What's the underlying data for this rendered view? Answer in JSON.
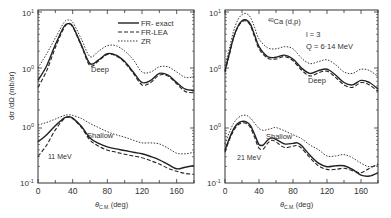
{
  "chart_data": [
    {
      "type": "line",
      "panel": "left",
      "annotation": "11 MeV",
      "xlabel": "θ_C.M. (deg)",
      "ylabel": "dσ/dΩ (mb/sr)",
      "xlim": [
        0,
        180
      ],
      "x_ticks": [
        0,
        40,
        80,
        120,
        160
      ],
      "y_tick_labels": [
        "10^1",
        "10^0",
        "10^0",
        "10^-1"
      ],
      "scale": "log",
      "legend": [
        "FR-exact",
        "FR-LEA",
        "ZR"
      ],
      "legend_position": "upper right",
      "groups": [
        {
          "name": "Deep",
          "x": [
            0,
            10,
            20,
            30,
            35,
            40,
            50,
            60,
            70,
            80,
            90,
            100,
            110,
            120,
            130,
            140,
            150,
            160,
            170,
            180
          ],
          "series": [
            {
              "name": "FR-exact",
              "values": [
                0.6,
                1.1,
                2.6,
                5.5,
                6.2,
                5.6,
                2.6,
                1.2,
                1.4,
                1.8,
                1.7,
                1.3,
                0.85,
                0.55,
                0.6,
                0.8,
                0.75,
                0.55,
                0.42,
                0.4
              ]
            },
            {
              "name": "FR-LEA",
              "values": [
                0.45,
                0.9,
                2.3,
                5.2,
                6.0,
                5.4,
                2.5,
                1.1,
                1.35,
                1.75,
                1.65,
                1.25,
                0.8,
                0.5,
                0.55,
                0.75,
                0.72,
                0.52,
                0.38,
                0.36
              ]
            },
            {
              "name": "ZR",
              "values": [
                1.0,
                1.8,
                3.4,
                6.5,
                7.2,
                6.6,
                3.3,
                1.6,
                2.0,
                2.5,
                2.5,
                2.0,
                1.4,
                0.85,
                0.85,
                1.05,
                1.05,
                0.85,
                0.68,
                0.7
              ]
            }
          ]
        },
        {
          "name": "Shallow",
          "x": [
            0,
            10,
            20,
            30,
            35,
            40,
            50,
            60,
            70,
            80,
            90,
            100,
            110,
            120,
            130,
            140,
            150,
            160,
            170,
            180
          ],
          "series": [
            {
              "name": "FR-exact",
              "values": [
                1.6,
                2.6,
                4.8,
                8.0,
                8.8,
                8.0,
                4.6,
                2.1,
                1.45,
                1.15,
                1.0,
                0.9,
                0.8,
                0.72,
                0.6,
                0.48,
                0.35,
                0.26,
                0.29,
                0.32
              ]
            },
            {
              "name": "FR-LEA",
              "values": [
                0.6,
                1.3,
                3.6,
                7.6,
                8.5,
                7.8,
                4.3,
                1.8,
                1.2,
                0.92,
                0.8,
                0.7,
                0.62,
                0.55,
                0.45,
                0.36,
                0.27,
                0.22,
                0.19,
                0.18
              ]
            },
            {
              "name": "ZR",
              "values": [
                5.0,
                6.0,
                7.5,
                9.5,
                10.0,
                9.6,
                7.8,
                5.6,
                4.2,
                3.2,
                2.6,
                2.2,
                1.8,
                1.5,
                1.5,
                1.4,
                1.05,
                0.75,
                0.72,
                0.8
              ]
            }
          ]
        }
      ]
    },
    {
      "type": "line",
      "panel": "right",
      "annotation": "21 MeV",
      "title": "40Ca (d,p)",
      "subtitle": [
        "l = 3",
        "Q = 6·14 MeV"
      ],
      "xlabel": "θ_C.M. (deg)",
      "ylabel": "",
      "xlim": [
        0,
        180
      ],
      "x_ticks": [
        0,
        40,
        80,
        120,
        160
      ],
      "y_tick_labels": [
        "10^1",
        "10^0",
        "10^0",
        "10^-1"
      ],
      "scale": "log",
      "groups": [
        {
          "name": "Deep",
          "x": [
            0,
            5,
            10,
            15,
            20,
            25,
            30,
            35,
            40,
            50,
            60,
            70,
            80,
            90,
            100,
            110,
            120,
            130,
            140,
            150,
            160,
            170,
            180
          ],
          "series": [
            {
              "name": "FR-exact",
              "values": [
                0.9,
                1.8,
                3.5,
                5.5,
                7.0,
                7.2,
                6.0,
                3.8,
                2.4,
                1.6,
                1.55,
                1.7,
                1.45,
                1.0,
                0.8,
                0.9,
                0.95,
                0.75,
                0.55,
                0.5,
                0.6,
                0.55,
                0.42
              ]
            },
            {
              "name": "FR-LEA",
              "values": [
                0.85,
                1.7,
                3.4,
                5.3,
                6.7,
                6.9,
                5.7,
                3.5,
                2.2,
                1.5,
                1.45,
                1.6,
                1.35,
                0.92,
                0.72,
                0.82,
                0.88,
                0.68,
                0.5,
                0.45,
                0.55,
                0.5,
                0.38
              ]
            },
            {
              "name": "ZR",
              "values": [
                1.1,
                2.2,
                4.5,
                7.2,
                9.0,
                9.4,
                8.0,
                5.2,
                3.3,
                2.3,
                2.2,
                2.4,
                2.2,
                1.5,
                1.2,
                1.3,
                1.4,
                1.15,
                0.85,
                0.8,
                0.95,
                0.9,
                0.7
              ]
            }
          ]
        },
        {
          "name": "Shallow",
          "x": [
            0,
            5,
            10,
            15,
            20,
            25,
            30,
            35,
            40,
            45,
            50,
            55,
            60,
            70,
            80,
            85,
            90,
            100,
            110,
            120,
            130,
            140,
            150,
            160,
            170,
            180
          ],
          "series": [
            {
              "name": "FR-exact",
              "values": [
                0.9,
                2.0,
                3.8,
                5.6,
                6.4,
                6.2,
                4.8,
                2.6,
                1.35,
                1.3,
                1.8,
                2.1,
                1.9,
                1.4,
                1.45,
                1.5,
                1.25,
                0.65,
                0.38,
                0.3,
                0.32,
                0.32,
                0.25,
                0.17,
                0.16,
                0.2
              ]
            },
            {
              "name": "FR-LEA",
              "values": [
                0.8,
                1.8,
                3.4,
                5.0,
                5.8,
                5.6,
                4.2,
                2.1,
                1.05,
                1.0,
                1.45,
                1.8,
                1.6,
                1.1,
                1.2,
                1.25,
                1.05,
                0.55,
                0.32,
                0.25,
                0.25,
                0.27,
                0.23,
                0.2,
                0.27,
                0.36
              ]
            },
            {
              "name": "ZR",
              "values": [
                1.4,
                3.0,
                5.6,
                8.0,
                9.5,
                9.6,
                8.0,
                5.6,
                4.0,
                3.5,
                3.7,
                4.0,
                4.2,
                3.4,
                2.6,
                2.3,
                2.0,
                1.3,
                0.95,
                0.62,
                0.62,
                0.68,
                0.55,
                0.38,
                0.3,
                0.34
              ]
            }
          ]
        }
      ]
    }
  ],
  "labels": {
    "left": {
      "y_top": "10",
      "y_top_exp": "1",
      "y_mid_up": "10",
      "y_mid_up_exp": "0",
      "y_mid_low": "10",
      "y_mid_low_exp": "0",
      "y_bot": "10",
      "y_bot_exp": "-1",
      "ylabel": "dσ /dΩ  (mb/sr)",
      "deep": "Deep",
      "shallow": "Shallow",
      "energy": "11 MeV",
      "xlabel_theta": "θ",
      "xlabel_sub": "C.M.",
      "xlabel_unit": "(deg)",
      "x_ticks": [
        "0",
        "40",
        "80",
        "120",
        "160"
      ],
      "legend": [
        {
          "label": "FR- exact",
          "style": "solid"
        },
        {
          "label": "FR-LEA",
          "style": "dashed"
        },
        {
          "label": "ZR",
          "style": "dotted"
        }
      ]
    },
    "right": {
      "y_top": "10",
      "y_top_exp": "1",
      "y_mid_up": "10",
      "y_mid_up_exp": "0",
      "y_mid_low": "10",
      "y_mid_low_exp": "0",
      "y_bot": "10",
      "y_bot_exp": "-1",
      "reaction_sup": "40",
      "reaction": "Ca (d,p)",
      "l_value": "l = 3",
      "q_value": "Q = 6·14 MeV",
      "deep": "Deep",
      "shallow": "Shallow",
      "energy": "21 MeV",
      "xlabel_theta": "θ",
      "xlabel_sub": "C.M.",
      "xlabel_unit": "(deg)",
      "x_ticks": [
        "0",
        "40",
        "80",
        "120",
        "160"
      ]
    }
  },
  "colors": {
    "line": "#222222",
    "axis": "#333333",
    "background": "#ffffff"
  }
}
